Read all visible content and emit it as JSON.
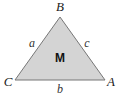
{
  "diagram": {
    "shape": "triangle",
    "fill_color": "#d4d4d4",
    "stroke_color": "#777777",
    "vertices": [
      {
        "label": "B",
        "x": 60,
        "y": 17
      },
      {
        "label": "C",
        "x": 15,
        "y": 80
      },
      {
        "label": "A",
        "x": 105,
        "y": 80
      }
    ],
    "sides": [
      {
        "label": "a",
        "between": "B-C"
      },
      {
        "label": "c",
        "between": "B-A"
      },
      {
        "label": "b",
        "between": "C-A"
      }
    ],
    "center_label": "M"
  },
  "labels": {
    "B": "B",
    "C": "C",
    "A": "A",
    "a": "a",
    "b": "b",
    "c": "c",
    "M": "M"
  }
}
